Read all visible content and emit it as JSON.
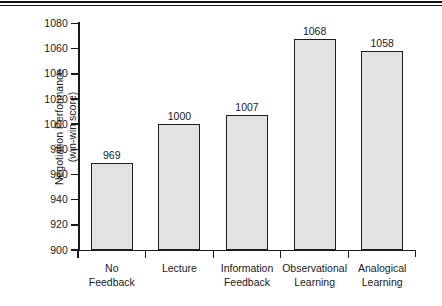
{
  "chart_data": {
    "type": "bar",
    "title": "",
    "xlabel": "",
    "ylabel": "Negotiation Performance\n(win-win score)",
    "categories": [
      "No\nFeedback",
      "Lecture",
      "Information\nFeedback",
      "Observational\nLearning",
      "Analogical\nLearning"
    ],
    "values": [
      969,
      1000,
      1007,
      1068,
      1058
    ],
    "value_labels": [
      "969",
      "1000",
      "1007",
      "1068",
      "1058"
    ],
    "ylim": [
      900,
      1080
    ],
    "ytick_labels": [
      "1080",
      "1060",
      "1040",
      "1020",
      "1000",
      "980",
      "960",
      "940",
      "920",
      "900"
    ],
    "ytick_values": [
      1080,
      1060,
      1040,
      1020,
      1000,
      980,
      960,
      940,
      920,
      900
    ],
    "grid": false,
    "legend": false,
    "legend_position": "none",
    "bar_fill_color": "#e3e3e3",
    "bar_edge_color": "#1c1c1c",
    "axis_color": "#1a1a1a",
    "background_color": "#ffffff"
  },
  "decorations": {
    "top_rule_color": "#111214"
  }
}
